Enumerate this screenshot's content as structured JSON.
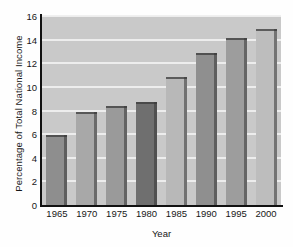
{
  "chart_data": {
    "type": "bar",
    "title": "",
    "xlabel": "Year",
    "ylabel": "Percentage of Total National Income",
    "categories": [
      "1965",
      "1970",
      "1975",
      "1980",
      "1985",
      "1990",
      "1995",
      "2000"
    ],
    "values": [
      5.9,
      7.9,
      8.4,
      8.7,
      10.8,
      12.9,
      14.1,
      14.9
    ],
    "ylim": [
      0,
      16
    ],
    "yticks": [
      0,
      2,
      4,
      6,
      8,
      10,
      12,
      14,
      16
    ],
    "ytick_labels": [
      "0",
      "2",
      "4",
      "6",
      "8",
      "10",
      "12",
      "14",
      "16"
    ],
    "grid": true,
    "grid_axis": "y",
    "legend": "none",
    "bar_colors": [
      "#8e8e8e",
      "#a8a8a8",
      "#9a9a9a",
      "#6f6f6f",
      "#b8b8b8",
      "#8f8f8f",
      "#9d9d9d",
      "#bdbdbd"
    ],
    "plot_background": "#c9c9c9",
    "gridline_color": "#efefef",
    "axis_color": "#111111",
    "text_color": "#171717"
  }
}
